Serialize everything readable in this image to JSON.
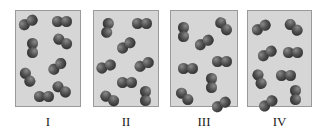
{
  "figure": {
    "panel_color": "#d6d6d6",
    "atom_color": "#444444",
    "panels": [
      {
        "label": "I",
        "x": 15,
        "width": 66,
        "molecules": [
          {
            "x": 12,
            "y": 11,
            "angle": -30
          },
          {
            "x": 46,
            "y": 10,
            "angle": 0
          },
          {
            "x": 17,
            "y": 37,
            "angle": 90
          },
          {
            "x": 47,
            "y": 30,
            "angle": 30
          },
          {
            "x": 41,
            "y": 55,
            "angle": -40
          },
          {
            "x": 12,
            "y": 66,
            "angle": 60
          },
          {
            "x": 46,
            "y": 78,
            "angle": 35
          },
          {
            "x": 28,
            "y": 85,
            "angle": 0
          }
        ]
      },
      {
        "label": "II",
        "x": 93,
        "width": 66,
        "molecules": [
          {
            "x": 14,
            "y": 17,
            "angle": 100
          },
          {
            "x": 48,
            "y": 12,
            "angle": 0
          },
          {
            "x": 32,
            "y": 34,
            "angle": -35
          },
          {
            "x": 12,
            "y": 55,
            "angle": -20
          },
          {
            "x": 50,
            "y": 53,
            "angle": -25
          },
          {
            "x": 33,
            "y": 71,
            "angle": 0
          },
          {
            "x": 16,
            "y": 87,
            "angle": 30
          },
          {
            "x": 52,
            "y": 85,
            "angle": 90
          }
        ]
      },
      {
        "label": "III",
        "x": 170,
        "width": 68,
        "molecules": [
          {
            "x": 13,
            "y": 21,
            "angle": 90
          },
          {
            "x": 53,
            "y": 15,
            "angle": 50
          },
          {
            "x": 33,
            "y": 31,
            "angle": -30
          },
          {
            "x": 17,
            "y": 57,
            "angle": 0
          },
          {
            "x": 51,
            "y": 50,
            "angle": 0
          },
          {
            "x": 41,
            "y": 72,
            "angle": 90
          },
          {
            "x": 14,
            "y": 85,
            "angle": 45
          },
          {
            "x": 50,
            "y": 93,
            "angle": -30
          }
        ]
      },
      {
        "label": "IV",
        "x": 247,
        "width": 65,
        "molecules": [
          {
            "x": 13,
            "y": 16,
            "angle": -30
          },
          {
            "x": 46,
            "y": 16,
            "angle": 40
          },
          {
            "x": 19,
            "y": 42,
            "angle": -30
          },
          {
            "x": 45,
            "y": 41,
            "angle": 0
          },
          {
            "x": 12,
            "y": 68,
            "angle": 70
          },
          {
            "x": 38,
            "y": 64,
            "angle": 0
          },
          {
            "x": 20,
            "y": 92,
            "angle": -35
          },
          {
            "x": 48,
            "y": 84,
            "angle": 90
          }
        ]
      }
    ]
  }
}
